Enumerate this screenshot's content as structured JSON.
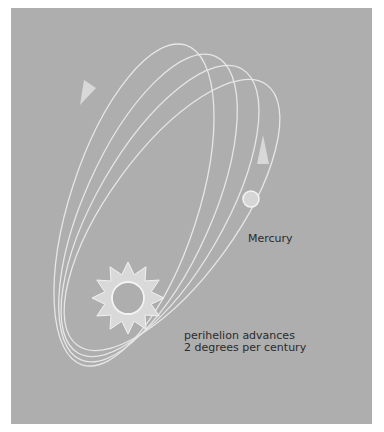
{
  "diagram": {
    "title_cutoff": "",
    "colors": {
      "background": "#aeaeae",
      "orbit_line": "#e6e6e6",
      "arrow": "#d8d8d8",
      "sun_fill": "#d9d9d9",
      "sun_stroke": "#f2f2f2",
      "planet_fill": "#d6d6d6",
      "text": "#2b2b2b"
    },
    "labels": {
      "planet": "Mercury",
      "note_line1": "perihelion advances",
      "note_line2": "2 degrees per century"
    },
    "elements": {
      "sun": {
        "icon": "sun-icon",
        "center": [
          128,
          298
        ],
        "points": 12
      },
      "planet": {
        "icon": "planet-circle",
        "center": [
          251,
          199
        ],
        "radius": 8
      },
      "orbits": {
        "count": 4
      },
      "arrows": [
        {
          "icon": "arrow-down-left-icon",
          "position": [
            86,
            92
          ]
        },
        {
          "icon": "arrow-up-icon",
          "position": [
            262,
            150
          ]
        }
      ]
    }
  }
}
